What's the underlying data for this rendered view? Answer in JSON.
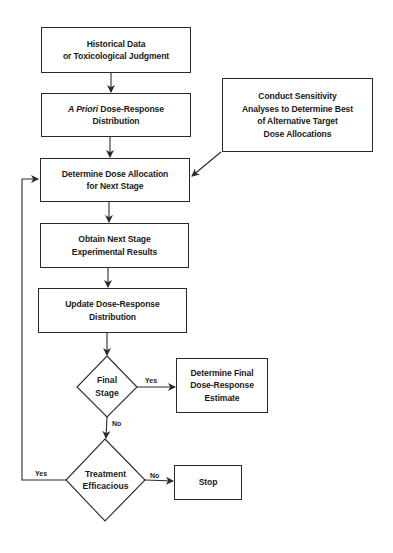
{
  "diagram": {
    "type": "flowchart",
    "nodes": {
      "historical": {
        "line1": "Historical Data",
        "line2": "or Toxicological Judgment"
      },
      "prior": {
        "italic": "A Priori",
        "line1_rest": " Dose-Response",
        "line2": "Distribution"
      },
      "sensitivity": {
        "line1": "Conduct Sensitivity",
        "line2": "Analyses to Determine Best",
        "line3": "of Alternative Target",
        "line4": "Dose Allocations"
      },
      "allocation": {
        "line1": "Determine Dose Allocation",
        "line2": "for Next Stage"
      },
      "obtain": {
        "line1": "Obtain Next Stage",
        "line2": "Experimental Results"
      },
      "update": {
        "line1": "Update Dose-Response",
        "line2": "Distribution"
      },
      "final_stage": {
        "line1": "Final",
        "line2": "Stage"
      },
      "final_estimate": {
        "line1": "Determine Final",
        "line2": "Dose-Response",
        "line3": "Estimate"
      },
      "efficacious": {
        "line1": "Treatment",
        "line2": "Efficacious"
      },
      "stop": {
        "label": "Stop"
      }
    },
    "edge_labels": {
      "final_yes": "Yes",
      "final_no": "No",
      "efficacious_yes": "Yes",
      "efficacious_no": "No"
    },
    "edges": [
      [
        "historical",
        "prior"
      ],
      [
        "prior",
        "allocation"
      ],
      [
        "sensitivity",
        "allocation"
      ],
      [
        "allocation",
        "obtain"
      ],
      [
        "obtain",
        "update"
      ],
      [
        "update",
        "final_stage"
      ],
      [
        "final_stage",
        "final_estimate",
        "Yes"
      ],
      [
        "final_stage",
        "efficacious",
        "No"
      ],
      [
        "efficacious",
        "stop",
        "No"
      ],
      [
        "efficacious",
        "allocation",
        "Yes"
      ]
    ],
    "colors": {
      "line": "#2a2a2a",
      "background": "#ffffff",
      "text": "#1a1a1a"
    }
  }
}
